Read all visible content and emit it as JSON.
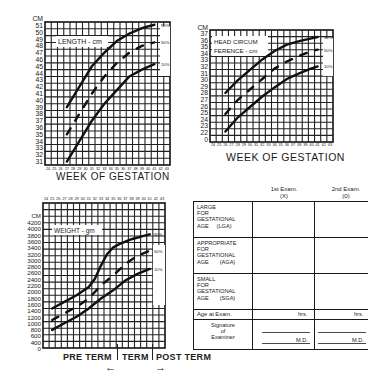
{
  "chart_data": [
    {
      "type": "line",
      "title": "LENGTH - cm",
      "xlabel": "WEEK OF GESTATION",
      "ylabel": "CM",
      "x": [
        24,
        25,
        26,
        27,
        28,
        29,
        30,
        31,
        32,
        33,
        34,
        35,
        36,
        37,
        38,
        39,
        40,
        41,
        42,
        43
      ],
      "x_tick_labels": [
        "24",
        "25",
        "26",
        "27",
        "28",
        "29",
        "30",
        "31",
        "32",
        "33",
        "34",
        "35",
        "36",
        "37",
        "38",
        "39",
        "40",
        "41",
        "42",
        "43"
      ],
      "y_tick_labels": [
        "51",
        "50",
        "49",
        "48",
        "47",
        "46",
        "45",
        "44",
        "43",
        "42",
        "41",
        "40",
        "39",
        "38",
        "37",
        "36",
        "35",
        "34",
        "33",
        "32",
        "31"
      ],
      "ylim": [
        30,
        51
      ],
      "grid": true,
      "series": [
        {
          "name": "90%",
          "x": [
            27,
            29,
            31,
            33,
            35,
            37,
            39,
            41
          ],
          "values": [
            38.5,
            41.5,
            44.5,
            46.5,
            48.2,
            49.3,
            50.1,
            50.6
          ]
        },
        {
          "name": "50%",
          "x": [
            27,
            29,
            31,
            33,
            35,
            37,
            39,
            41
          ],
          "values": [
            34.5,
            37.5,
            40.5,
            43,
            45,
            46.5,
            47.5,
            48
          ]
        },
        {
          "name": "10%",
          "x": [
            27,
            29,
            31,
            33,
            35,
            37,
            39,
            41
          ],
          "values": [
            30.5,
            33.5,
            36.5,
            39,
            41,
            43,
            44,
            44.8
          ]
        }
      ]
    },
    {
      "type": "line",
      "title": "HEAD CIRCUMFERENCE - cm",
      "title_lines": [
        "HEAD CIRCUM",
        "FERENCE - cm"
      ],
      "xlabel": "WEEK OF GESTATION",
      "ylabel": "CM",
      "x_tick_labels": [
        "24",
        "25",
        "26",
        "27",
        "28",
        "29",
        "30",
        "31",
        "32",
        "33",
        "34",
        "35",
        "36",
        "37",
        "38",
        "39",
        "40",
        "41",
        "42",
        "43"
      ],
      "y_tick_labels": [
        "37",
        "36",
        "35",
        "34",
        "33",
        "32",
        "31",
        "30",
        "29",
        "28",
        "27",
        "26",
        "25",
        "24",
        "23",
        "22",
        "0"
      ],
      "ylim": [
        21,
        37
      ],
      "grid": true,
      "series": [
        {
          "name": "90%",
          "x": [
            26,
            28,
            30,
            32,
            34,
            36,
            38,
            40,
            41
          ],
          "values": [
            28,
            29.8,
            31.3,
            32.8,
            34,
            34.9,
            35.4,
            35.8,
            36
          ]
        },
        {
          "name": "50%",
          "x": [
            26,
            28,
            30,
            32,
            34,
            36,
            38,
            40,
            41
          ],
          "values": [
            25,
            27,
            28.5,
            30,
            31.5,
            32.5,
            33.3,
            34,
            34.2
          ]
        },
        {
          "name": "10%",
          "x": [
            26,
            28,
            30,
            32,
            34,
            36,
            38,
            40,
            41
          ],
          "values": [
            22.5,
            24.5,
            26,
            27.5,
            28.8,
            30,
            30.8,
            31.5,
            31.8
          ]
        }
      ]
    },
    {
      "type": "line",
      "title": "WEIGHT - gm",
      "xlabel": "WEEK OF GESTATION",
      "ylabel": "CM",
      "x_tick_labels": [
        "24",
        "25",
        "26",
        "27",
        "28",
        "29",
        "30",
        "31",
        "32",
        "33",
        "34",
        "35",
        "36",
        "37",
        "38",
        "39",
        "40",
        "41",
        "42",
        "43"
      ],
      "y_tick_labels": [
        "4200",
        "4000",
        "3800",
        "3600",
        "3400",
        "3200",
        "3000",
        "2800",
        "2600",
        "2400",
        "2200",
        "2000",
        "1800",
        "1600",
        "1400",
        "1200",
        "1000",
        "800",
        "600",
        "400",
        "0"
      ],
      "ylim": [
        0,
        4400
      ],
      "grid": true,
      "series": [
        {
          "name": "90%",
          "x": [
            25,
            27,
            29,
            31,
            32,
            33,
            34,
            35,
            36,
            38,
            40,
            41
          ],
          "values": [
            1200,
            1400,
            1600,
            1850,
            2100,
            2500,
            2850,
            3050,
            3150,
            3300,
            3400,
            3450
          ]
        },
        {
          "name": "50%",
          "x": [
            25,
            27,
            29,
            31,
            33,
            35,
            37,
            39,
            41
          ],
          "values": [
            850,
            1050,
            1250,
            1500,
            1900,
            2200,
            2550,
            2800,
            2950
          ]
        },
        {
          "name": "10%",
          "x": [
            25,
            27,
            29,
            31,
            33,
            35,
            37,
            39,
            41
          ],
          "values": [
            550,
            750,
            950,
            1200,
            1500,
            1750,
            2050,
            2250,
            2400
          ]
        }
      ],
      "annotations": [
        "PRE TERM",
        "TERM",
        "POST TERM"
      ]
    }
  ],
  "length_chart": {
    "title": "LENGTH - cm",
    "unit": "CM",
    "xlabel": "WEEK OF GESTATION"
  },
  "head_chart": {
    "title_1": "HEAD CIRCUM",
    "title_2": "FERENCE - cm",
    "unit": "CM",
    "xlabel": "WEEK OF GESTATION"
  },
  "weight_chart": {
    "title": "WEIGHT - gm",
    "unit": "CM",
    "xlabel": "WEEK OF GESTATION"
  },
  "percentiles": [
    "90%",
    "50%",
    "10%"
  ],
  "term_labels": {
    "pre": "PRE TERM",
    "term": "TERM",
    "post": "POST TERM",
    "left_arrow": "←",
    "right_arrow": "→"
  },
  "table": {
    "headers": [
      {
        "line1": "1st Exam.",
        "line2": "(X)"
      },
      {
        "line1": "2nd Exam.",
        "line2": "(0)"
      }
    ],
    "rows": [
      {
        "lines": [
          "LARGE",
          "FOR",
          "GESTATIONAL",
          "AGE     (LGA)"
        ]
      },
      {
        "lines": [
          "APPROPRIATE",
          "FOR",
          "GESTATIONAL",
          "AGE       (AGA)"
        ]
      },
      {
        "lines": [
          "SMALL",
          "FOR",
          "GESTATIONAL",
          "AGE       (SGA)"
        ]
      }
    ],
    "age_label": "Age at Exam.",
    "age_unit": "hrs.",
    "signature_lines": [
      "Signature",
      "of",
      "Examiner"
    ],
    "md_label": "M.D."
  }
}
